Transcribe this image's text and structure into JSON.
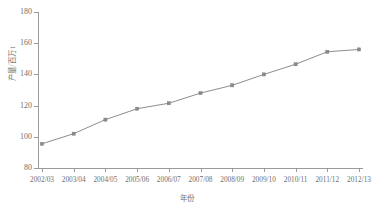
{
  "chart_data": {
    "type": "line",
    "title": "",
    "xlabel": "年份",
    "ylabel": "产量/百万 t",
    "categories": [
      "2002/03",
      "2003/04",
      "2004/05",
      "2005/06",
      "2006/07",
      "2007/08",
      "2008/09",
      "2009/10",
      "2010/11",
      "2011/12",
      "2012/13"
    ],
    "values": [
      95.5,
      102.0,
      111.0,
      118.0,
      121.5,
      128.0,
      133.0,
      140.0,
      146.5,
      154.5,
      156.0
    ],
    "ylim": [
      80,
      180
    ],
    "yticks": [
      80,
      100,
      120,
      140,
      160,
      180
    ],
    "grid": false,
    "legend": "none",
    "series_color": "#8a8a8a",
    "marker": "square",
    "axis_color": "#9a9a9a",
    "text_color": "#6f6f6f"
  }
}
